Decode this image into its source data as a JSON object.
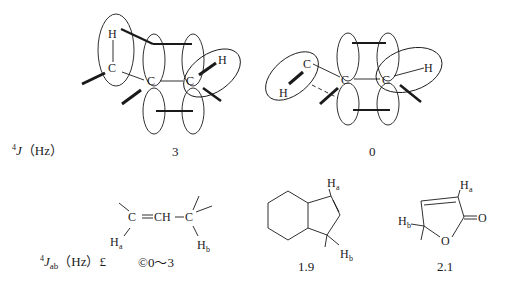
{
  "top_row": {
    "label": {
      "superscript": "4",
      "symbol": "J",
      "unit": "（Hz）"
    },
    "conformation_a": {
      "value": "3",
      "atoms": {
        "c": "C",
        "h": "H"
      }
    },
    "conformation_b": {
      "value": "0",
      "atoms": {
        "c": "C",
        "h": "H"
      }
    }
  },
  "bottom_row": {
    "label": {
      "superscript": "4",
      "symbol": "J",
      "subscript": "ab",
      "unit": "（Hz）£",
      "range": "©0～3"
    },
    "allylic_chain": {
      "formula_c1": "C",
      "double_bond": "═",
      "ch": "CH",
      "single_bond": "—",
      "formula_c2": "C",
      "ha": "H",
      "ha_sub": "a",
      "hb": "H",
      "hb_sub": "b"
    },
    "hexahydroindene": {
      "value": "1.9",
      "ha": "H",
      "ha_sub": "a",
      "hb": "H",
      "hb_sub": "b"
    },
    "furanone": {
      "value": "2.1",
      "ha": "H",
      "ha_sub": "a",
      "hb": "H",
      "hb_sub": "b",
      "o_ring": "O",
      "o_carbonyl": "O"
    }
  }
}
